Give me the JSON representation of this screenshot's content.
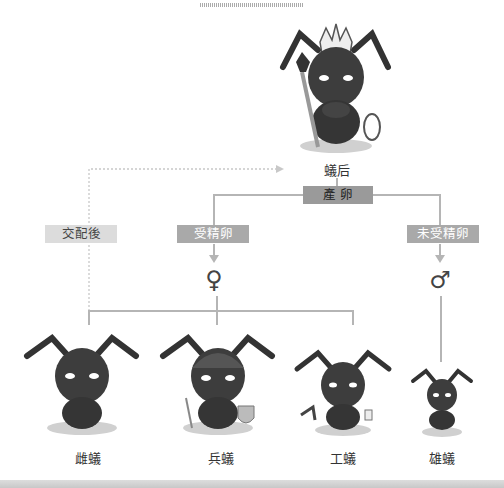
{
  "diagram": {
    "title_decoration": "top-stripe",
    "queen": {
      "label": "蟻后",
      "icon": "queen-ant-icon"
    },
    "lay_eggs": {
      "label": "產 卵"
    },
    "mating": {
      "label": "交配後"
    },
    "fertilized": {
      "label": "受精卵",
      "symbol": "♀"
    },
    "unfertilized": {
      "label": "未受精卵",
      "symbol": "♂"
    },
    "castes": [
      {
        "label": "雌蟻",
        "icon": "female-ant-icon"
      },
      {
        "label": "兵蟻",
        "icon": "soldier-ant-icon"
      },
      {
        "label": "工蟻",
        "icon": "worker-ant-icon"
      },
      {
        "label": "雄蟻",
        "icon": "male-ant-icon"
      }
    ],
    "colors": {
      "box_dark": "#9a9a9a",
      "box_mid": "#a9a9a9",
      "box_light": "#dcdcdc",
      "line": "#b5b5b5",
      "ant_body": "#3a3a3a"
    }
  }
}
